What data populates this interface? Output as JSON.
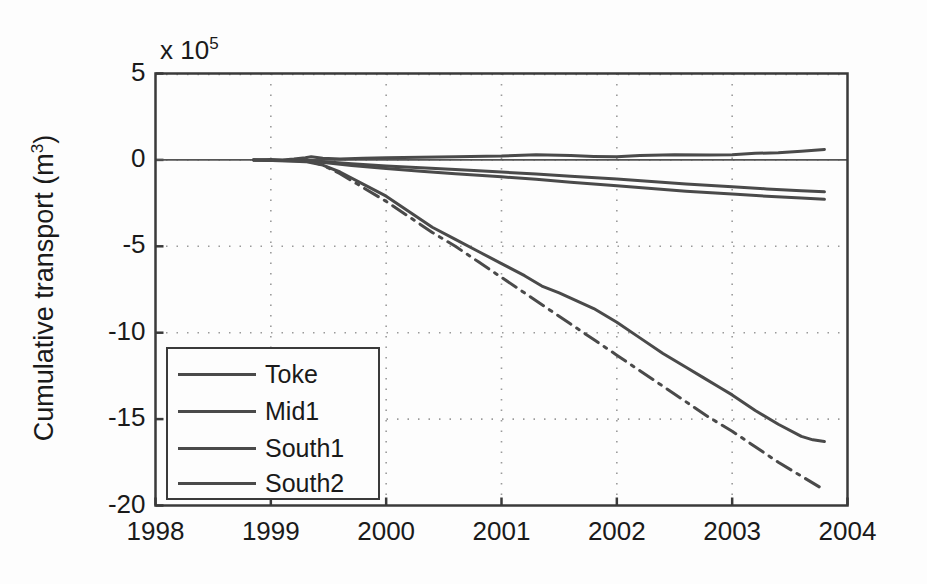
{
  "figure": {
    "background_color": "#fdfdfd",
    "axis_color": "#3a3a3a",
    "grid_color": "#9a9a9a",
    "line_color": "#4a4a4a"
  },
  "axis": {
    "exponent_label": "x 10",
    "exponent_value": "5",
    "ylabel_text": "Cumulative transport (m",
    "ylabel_sup": "3",
    "ylabel_close": ")"
  },
  "legend": {
    "items": [
      {
        "label": "Toke",
        "style": "solid"
      },
      {
        "label": "Mid1",
        "style": "solid"
      },
      {
        "label": "South1",
        "style": "solid"
      },
      {
        "label": "South2",
        "style": "solid"
      }
    ]
  },
  "chart_data": {
    "type": "line",
    "title": "",
    "xlabel": "",
    "ylabel": "Cumulative transport (m^3)",
    "y_scale_exponent": 5,
    "xlim": [
      1998,
      2004
    ],
    "ylim": [
      -20,
      5
    ],
    "xticks": [
      1998,
      1999,
      2000,
      2001,
      2002,
      2003,
      2004
    ],
    "xtick_labels": [
      "1998",
      "1999",
      "2000",
      "2001",
      "2002",
      "2003",
      "2004"
    ],
    "yticks": [
      5,
      0,
      -5,
      -10,
      -15,
      -20
    ],
    "ytick_labels": [
      "5",
      "0",
      "-5",
      "-10",
      "-15",
      "-20"
    ],
    "grid": true,
    "legend_position": "lower-left",
    "series": [
      {
        "name": "Toke",
        "style": "solid",
        "x": [
          1998.85,
          1999.0,
          1999.1,
          1999.2,
          1999.3,
          1999.35,
          1999.45,
          1999.6,
          1999.8,
          2000.0,
          2000.3,
          2000.6,
          2001.0,
          2001.3,
          2001.6,
          2001.8,
          2002.0,
          2002.2,
          2002.5,
          2002.8,
          2003.0,
          2003.2,
          2003.4,
          2003.6,
          2003.8
        ],
        "y": [
          0.0,
          0.02,
          0.0,
          0.05,
          0.12,
          0.18,
          0.1,
          0.05,
          0.1,
          0.12,
          0.15,
          0.18,
          0.22,
          0.3,
          0.25,
          0.2,
          0.18,
          0.25,
          0.3,
          0.28,
          0.3,
          0.38,
          0.42,
          0.5,
          0.6
        ]
      },
      {
        "name": "Mid1",
        "style": "solid",
        "x": [
          1998.85,
          1999.0,
          1999.2,
          1999.35,
          1999.5,
          1999.7,
          2000.0,
          2000.3,
          2000.6,
          2001.0,
          2001.3,
          2001.6,
          2002.0,
          2002.3,
          2002.6,
          2003.0,
          2003.3,
          2003.6,
          2003.8
        ],
        "y": [
          0.0,
          -0.02,
          -0.04,
          -0.05,
          -0.12,
          -0.22,
          -0.35,
          -0.45,
          -0.55,
          -0.7,
          -0.82,
          -0.95,
          -1.1,
          -1.25,
          -1.4,
          -1.55,
          -1.68,
          -1.78,
          -1.85
        ]
      },
      {
        "name": "South1",
        "style": "solid",
        "x": [
          1998.85,
          1999.0,
          1999.2,
          1999.35,
          1999.5,
          1999.7,
          2000.0,
          2000.3,
          2000.6,
          2001.0,
          2001.3,
          2001.6,
          2002.0,
          2002.3,
          2002.6,
          2003.0,
          2003.3,
          2003.6,
          2003.8
        ],
        "y": [
          0.0,
          -0.03,
          -0.05,
          -0.08,
          -0.18,
          -0.32,
          -0.5,
          -0.65,
          -0.8,
          -0.98,
          -1.12,
          -1.3,
          -1.5,
          -1.66,
          -1.82,
          -1.98,
          -2.1,
          -2.2,
          -2.28
        ]
      },
      {
        "name": "South2",
        "style": "solid",
        "x": [
          1998.85,
          1999.1,
          1999.3,
          1999.45,
          1999.6,
          1999.8,
          2000.0,
          2000.2,
          2000.4,
          2000.6,
          2000.8,
          2001.0,
          2001.2,
          2001.35,
          2001.5,
          2001.6,
          2001.8,
          2002.0,
          2002.2,
          2002.4,
          2002.6,
          2002.75,
          2002.9,
          2003.0,
          2003.2,
          2003.4,
          2003.6,
          2003.7,
          2003.8
        ],
        "y": [
          0.0,
          -0.05,
          -0.1,
          -0.3,
          -0.7,
          -1.4,
          -2.1,
          -3.0,
          -3.9,
          -4.6,
          -5.3,
          -6.0,
          -6.7,
          -7.3,
          -7.7,
          -8.0,
          -8.6,
          -9.4,
          -10.3,
          -11.2,
          -12.0,
          -12.6,
          -13.2,
          -13.6,
          -14.5,
          -15.3,
          -16.0,
          -16.2,
          -16.3
        ]
      },
      {
        "name": "South2-dashdot",
        "style": "dashdot",
        "x": [
          1999.3,
          1999.45,
          1999.6,
          1999.8,
          2000.0,
          2000.2,
          2000.4,
          2000.6,
          2000.8,
          2001.0,
          2001.2,
          2001.4,
          2001.6,
          2001.8,
          2002.0,
          2002.2,
          2002.4,
          2002.6,
          2002.8,
          2003.0,
          2003.2,
          2003.4,
          2003.6,
          2003.8
        ],
        "y": [
          0.0,
          -0.3,
          -0.8,
          -1.6,
          -2.4,
          -3.3,
          -4.2,
          -5.0,
          -5.9,
          -6.8,
          -7.7,
          -8.6,
          -9.5,
          -10.4,
          -11.3,
          -12.2,
          -13.1,
          -14.0,
          -14.9,
          -15.7,
          -16.6,
          -17.5,
          -18.3,
          -19.1
        ]
      }
    ]
  }
}
